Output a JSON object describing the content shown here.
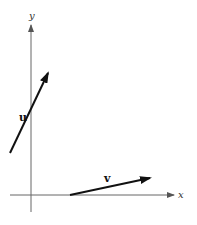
{
  "diagram": {
    "type": "vector-plot",
    "axes": {
      "x_label": "x",
      "y_label": "y"
    },
    "vectors": [
      {
        "name": "u",
        "label": "u",
        "tail": [
          10,
          153
        ],
        "head": [
          48,
          73
        ],
        "color": "#111111"
      },
      {
        "name": "v",
        "label": "v",
        "tail": [
          70,
          195
        ],
        "head": [
          150,
          178
        ],
        "color": "#111111"
      }
    ]
  }
}
